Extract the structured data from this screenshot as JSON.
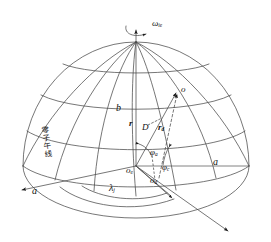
{
  "figure": {
    "domain": "diagram",
    "background": "#ffffff",
    "stroke_color": "#3a3a3a",
    "text_color": "#111111"
  },
  "labels": {
    "omega": "ω",
    "omega_sub": "ie",
    "semi_minor": "b",
    "semi_major_right": "a",
    "semi_major_left": "a",
    "point_o": "o",
    "vector_r": "r",
    "vector_rd": "r",
    "vector_rd_sub": "d",
    "distance_D": "D",
    "phi_a": "φ",
    "phi_a_sub": "a",
    "phi_c": "φ",
    "phi_c_sub": "c",
    "origin_e": "o",
    "origin_e_sub": "e",
    "origin_d": "o",
    "origin_d_sub": "d",
    "lambda": "λ",
    "lambda_sub": "j",
    "prime_meridian": "零子午线"
  },
  "geometry": {
    "sphere_center_x": 135,
    "sphere_center_y": 165,
    "sphere_radius_x": 112,
    "sphere_radius_y": 112,
    "pole_x": 136,
    "pole_y": 42,
    "point_o_x": 177,
    "point_o_y": 92,
    "num_meridians": 7,
    "num_parallels": 4
  }
}
